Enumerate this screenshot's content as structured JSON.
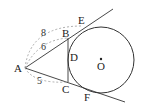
{
  "diagram": {
    "type": "geometry",
    "points": {
      "A": {
        "label": "A",
        "x": 25,
        "y": 68
      },
      "B": {
        "label": "B",
        "x": 68,
        "y": 38
      },
      "C": {
        "label": "C",
        "x": 68,
        "y": 82
      },
      "D": {
        "label": "D",
        "x": 68,
        "y": 57
      },
      "E": {
        "label": "E",
        "x": 82,
        "y": 26
      },
      "F": {
        "label": "F",
        "x": 90,
        "y": 90
      },
      "O": {
        "label": "O",
        "x": 101,
        "y": 60
      }
    },
    "circle": {
      "center": "O",
      "radius": 33
    },
    "measurements": {
      "AE": "8",
      "AB": "6",
      "AC": "5"
    },
    "colors": {
      "line": "#333333",
      "dashed": "#999999"
    }
  }
}
